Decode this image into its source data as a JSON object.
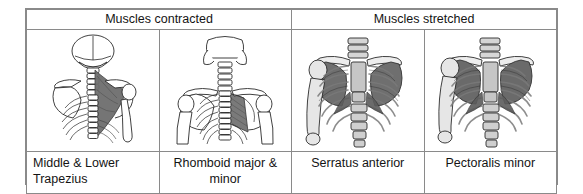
{
  "figure": {
    "name": "muscles-contracted-stretched-comparison",
    "columns": 4,
    "colors": {
      "border": "#8a8a8a",
      "text": "#141414",
      "bone_fill": "#f2f2f2",
      "bone_line": "#2b2b2b",
      "muscle_shade": "#7d7d7d",
      "muscle_shade_dark": "#5f5f5f",
      "cartilage": "#c9c9c9",
      "background": "#ffffff"
    }
  },
  "header": {
    "groups": [
      {
        "label": "Muscles contracted",
        "span": 2,
        "name": "header-muscles-contracted"
      },
      {
        "label": "Muscles stretched",
        "span": 2,
        "name": "header-muscles-stretched"
      }
    ]
  },
  "cells": [
    {
      "index": 0,
      "group": "Muscles contracted",
      "caption": "Middle & Lower Trapezius",
      "caption_align": "left",
      "figure_name": "posterior-torso-trapezius-diagram",
      "view": "posterior",
      "highlighted_muscle": "Middle & Lower Trapezius",
      "highlight_side": "right",
      "style": "line-drawing"
    },
    {
      "index": 1,
      "group": "Muscles contracted",
      "caption": "Rhomboid major & minor",
      "caption_align": "center",
      "figure_name": "posterior-torso-rhomboid-diagram",
      "view": "posterior",
      "highlighted_muscle": "Rhomboid major & minor",
      "highlight_side": "right",
      "style": "line-drawing"
    },
    {
      "index": 2,
      "group": "Muscles stretched",
      "caption": "Serratus anterior",
      "caption_align": "center",
      "figure_name": "anterior-ribcage-serratus-anterior-diagram",
      "view": "anterior",
      "highlighted_muscle": "Serratus anterior",
      "highlight_side": "left",
      "style": "shaded-drawing"
    },
    {
      "index": 3,
      "group": "Muscles stretched",
      "caption": "Pectoralis minor",
      "caption_align": "center",
      "figure_name": "anterior-ribcage-pectoralis-minor-diagram",
      "view": "anterior",
      "highlighted_muscle": "Pectoralis minor",
      "highlight_side": "left",
      "style": "shaded-drawing"
    }
  ]
}
